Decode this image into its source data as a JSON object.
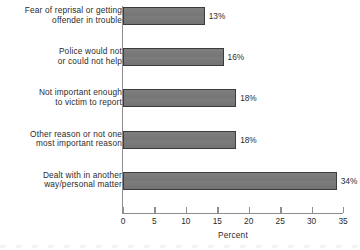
{
  "chart_data": {
    "type": "bar",
    "orientation": "horizontal",
    "title": "",
    "xlabel": "Percent",
    "ylabel": "",
    "xlim": [
      0,
      35
    ],
    "xticks": [
      0,
      5,
      10,
      15,
      20,
      25,
      30,
      35
    ],
    "grid": false,
    "legend": null,
    "bar_color": "#7b7b7b",
    "bar_border_color": "#3c3c3c",
    "axis_color": "#8e8e8e",
    "text_color": "#2b2b2b",
    "categories": [
      "Fear of reprisal or getting\noffender in trouble",
      "Police would not\nor could not help",
      "Not important enough\nto victim to report",
      "Other reason or not one\nmost important reason",
      "Dealt with in another\nway/personal matter"
    ],
    "values": [
      13,
      16,
      18,
      18,
      34
    ],
    "data_labels": [
      "13%",
      "16%",
      "18%",
      "18%",
      "34%"
    ]
  }
}
